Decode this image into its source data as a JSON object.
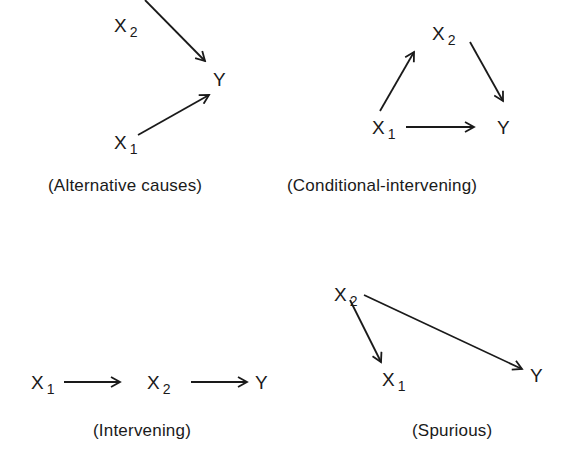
{
  "diagrams": [
    {
      "caption": "(Alternative causes)",
      "nodes": {
        "x2": {
          "base": "X",
          "sub": "2"
        },
        "y": {
          "base": "Y",
          "sub": ""
        },
        "x1": {
          "base": "X",
          "sub": "1"
        }
      },
      "edges": [
        [
          "X2",
          "Y"
        ],
        [
          "X1",
          "Y"
        ]
      ]
    },
    {
      "caption": "(Conditional-intervening)",
      "nodes": {
        "x2": {
          "base": "X",
          "sub": "2"
        },
        "y": {
          "base": "Y",
          "sub": ""
        },
        "x1": {
          "base": "X",
          "sub": "1"
        }
      },
      "edges": [
        [
          "X1",
          "X2"
        ],
        [
          "X2",
          "Y"
        ],
        [
          "X1",
          "Y"
        ]
      ]
    },
    {
      "caption": "(Intervening)",
      "nodes": {
        "x1": {
          "base": "X",
          "sub": "1"
        },
        "x2": {
          "base": "X",
          "sub": "2"
        },
        "y": {
          "base": "Y",
          "sub": ""
        }
      },
      "edges": [
        [
          "X1",
          "X2"
        ],
        [
          "X2",
          "Y"
        ]
      ]
    },
    {
      "caption": "(Spurious)",
      "nodes": {
        "x2": {
          "base": "X",
          "sub": "2"
        },
        "x1": {
          "base": "X",
          "sub": "1"
        },
        "y": {
          "base": "Y",
          "sub": ""
        }
      },
      "edges": [
        [
          "X2",
          "X1"
        ],
        [
          "X2",
          "Y"
        ]
      ]
    }
  ],
  "colors": {
    "ink": "#1a1a1a",
    "background": "#ffffff"
  }
}
